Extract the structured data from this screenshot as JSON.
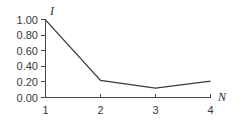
{
  "chart_data": {
    "type": "line",
    "title": "",
    "subtitle": "",
    "xlabel": "N",
    "ylabel": "I",
    "x": [
      1,
      2,
      3,
      4
    ],
    "values": [
      1.0,
      0.22,
      0.12,
      0.21
    ],
    "series": [
      {
        "name": "I",
        "x": [
          1,
          2,
          3,
          4
        ],
        "values": [
          1.0,
          0.22,
          0.12,
          0.21
        ]
      }
    ],
    "xlim": [
      1,
      4
    ],
    "ylim": [
      0.0,
      1.0
    ],
    "x_tick_labels": [
      "1",
      "2",
      "3",
      "4"
    ],
    "y_tick_labels": [
      "0.00",
      "0.20",
      "0.40",
      "0.60",
      "0.80",
      "1.00"
    ],
    "y_tick_values": [
      0.0,
      0.2,
      0.4,
      0.6,
      0.8,
      1.0
    ],
    "grid": false,
    "legend": false,
    "legend_position": "none",
    "annotations": [],
    "line_color": "#3c3c3c",
    "axis_color": "#4a4a4a",
    "background_color": "#ffffff"
  }
}
